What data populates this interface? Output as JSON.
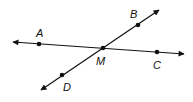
{
  "diagram": {
    "type": "intersecting-lines",
    "color": "#111111",
    "lines": [
      {
        "name": "AC",
        "from": [
          13,
          42
        ],
        "to": [
          184,
          54
        ],
        "arrows": "both"
      },
      {
        "name": "BD",
        "from": [
          159,
          10
        ],
        "to": [
          41,
          90
        ],
        "arrows": "both"
      }
    ],
    "points": [
      {
        "id": "A",
        "label": "A",
        "x": 39,
        "y": 44,
        "label_x": 36,
        "label_y": 37
      },
      {
        "id": "B",
        "label": "B",
        "x": 138,
        "y": 25,
        "label_x": 130,
        "label_y": 18
      },
      {
        "id": "C",
        "label": "C",
        "x": 157,
        "y": 52,
        "label_x": 153,
        "label_y": 69
      },
      {
        "id": "D",
        "label": "D",
        "x": 62,
        "y": 75,
        "label_x": 63,
        "label_y": 91
      },
      {
        "id": "M",
        "label": "M",
        "x": 103,
        "y": 48,
        "label_x": 96,
        "label_y": 65
      }
    ]
  }
}
